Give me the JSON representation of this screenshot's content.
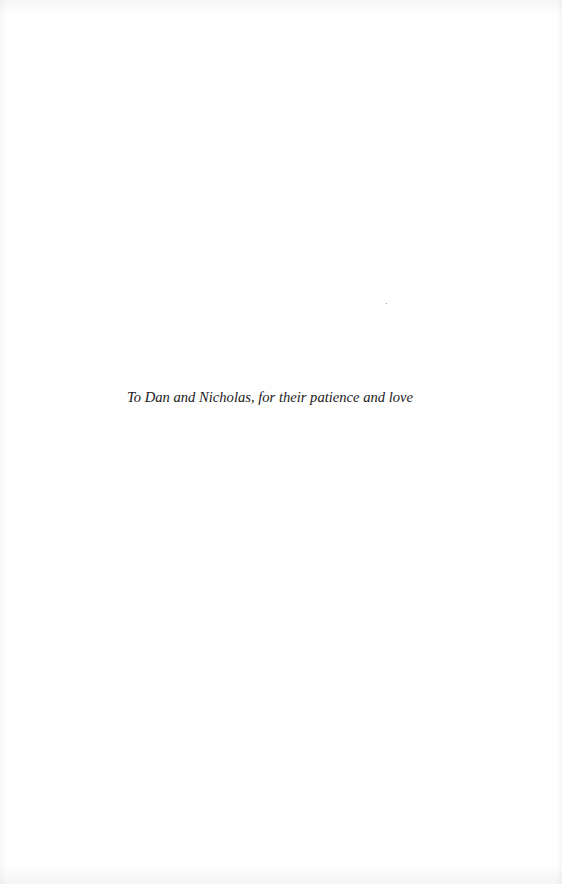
{
  "page": {
    "type": "dedication",
    "background_color": "#ffffff",
    "text_color": "#1b1b1b"
  },
  "dedication": {
    "text": "To Dan and Nicholas, for their patience and love"
  }
}
